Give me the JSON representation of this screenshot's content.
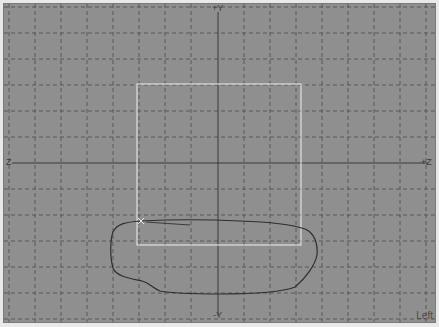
{
  "viewport": {
    "name": "Left",
    "background": "#8f8f8f",
    "grid": {
      "spacing_px": 26,
      "color": "#555555",
      "style": "dashed"
    },
    "axes": {
      "vertical_label_top": "+Y",
      "vertical_label_bottom": "-Y",
      "horizontal_label_left": "Z",
      "horizontal_label_right": "+Z",
      "color": "#3a3a3a"
    },
    "selection_rectangle": {
      "color": "#f2f2f2",
      "x1": 137,
      "y1": 84,
      "x2": 301,
      "y2": 245
    },
    "sketch_curve": {
      "color": "#2e2e2e"
    }
  }
}
